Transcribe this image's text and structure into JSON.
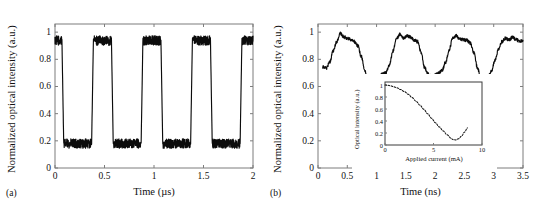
{
  "figure": {
    "panel_a_tag": "(a)",
    "panel_b_tag": "(b)"
  },
  "chart_data": [
    {
      "id": "panel_a",
      "type": "line",
      "title": "",
      "xlabel": "Time (µs)",
      "ylabel": "Normalized optical intensity (a.u.)",
      "xlim": [
        0,
        2
      ],
      "ylim": [
        0,
        1.06
      ],
      "xticks": [
        0,
        0.5,
        1,
        1.5,
        2
      ],
      "xticklabels": [
        "0",
        "0.5",
        "1",
        "1.5",
        "2"
      ],
      "yticks": [
        0,
        0.2,
        0.4,
        0.6,
        0.8,
        1
      ],
      "yticklabels": [
        "0",
        "0.2",
        "0.4",
        "0.6",
        "0.8",
        "1"
      ],
      "grid": false,
      "legend": null,
      "description": "Noisy square-wave modulated optical intensity, period 0.5 microseconds, high level about 0.95, low level about 0.18",
      "waveform": {
        "kind": "square",
        "period_us": 0.5,
        "high_level": 0.95,
        "low_level": 0.18,
        "duty_high": 0.4,
        "phase_offset_us": 0.07,
        "noise_amplitude": 0.035,
        "edge_time_us": 0.018
      },
      "series": [
        {
          "name": "optical intensity",
          "x": [
            0,
            0.07,
            0.09,
            0.34,
            0.37,
            0.56,
            0.58,
            0.84,
            0.87,
            1.06,
            1.08,
            1.34,
            1.37,
            1.56,
            1.58,
            1.84,
            1.87,
            2.0
          ],
          "values": [
            0.95,
            0.93,
            0.18,
            0.17,
            0.96,
            0.94,
            0.18,
            0.17,
            0.97,
            0.94,
            0.18,
            0.18,
            0.95,
            0.94,
            0.19,
            0.18,
            0.97,
            0.93
          ]
        }
      ]
    },
    {
      "id": "panel_b",
      "type": "line",
      "title": "",
      "xlabel": "Time (ns)",
      "ylabel": "Normalized optical intensity (a.u.)",
      "xlim": [
        0,
        3.5
      ],
      "ylim": [
        0,
        1.06
      ],
      "xticks": [
        0,
        0.5,
        1,
        1.5,
        2,
        2.5,
        3,
        3.5
      ],
      "xticklabels": [
        "0",
        "0.5",
        "1",
        "1.5",
        "2",
        "2.5",
        "3",
        "3.5"
      ],
      "yticks": [
        0,
        0.2,
        0.4,
        0.6,
        0.8,
        1
      ],
      "yticklabels": [
        "0",
        "0.2",
        "0.4",
        "0.6",
        "0.8",
        "1"
      ],
      "grid": false,
      "legend": null,
      "description": "Noisy quasi-sinusoidal optical intensity oscillation with period about 0.95 ns, peaks near 1.0 and troughs near 0.62",
      "series": [
        {
          "name": "optical intensity",
          "x": [
            0.08,
            0.14,
            0.2,
            0.26,
            0.32,
            0.38,
            0.44,
            0.5,
            0.56,
            0.62,
            0.68,
            0.74,
            0.8,
            0.86,
            0.92,
            0.98,
            1.04,
            1.1,
            1.16,
            1.22,
            1.28,
            1.34,
            1.4,
            1.46,
            1.52,
            1.58,
            1.64,
            1.7,
            1.76,
            1.82,
            1.88,
            1.94,
            2.0,
            2.06,
            2.12,
            2.18,
            2.24,
            2.3,
            2.36,
            2.42,
            2.48,
            2.54,
            2.6,
            2.66,
            2.72,
            2.78,
            2.84,
            2.9,
            2.96,
            3.02,
            3.08,
            3.14,
            3.2,
            3.26,
            3.32,
            3.38,
            3.44,
            3.5
          ],
          "values": [
            0.745,
            0.735,
            0.78,
            0.86,
            0.93,
            0.99,
            0.965,
            0.955,
            0.945,
            0.93,
            0.9,
            0.82,
            0.72,
            0.63,
            0.605,
            0.64,
            0.675,
            0.69,
            0.7,
            0.76,
            0.86,
            0.95,
            0.985,
            0.955,
            0.97,
            0.965,
            0.94,
            0.93,
            0.85,
            0.74,
            0.69,
            0.675,
            0.685,
            0.7,
            0.72,
            0.78,
            0.87,
            0.955,
            0.975,
            0.95,
            0.945,
            0.94,
            0.92,
            0.85,
            0.74,
            0.665,
            0.65,
            0.665,
            0.71,
            0.79,
            0.87,
            0.93,
            0.955,
            0.945,
            0.96,
            0.945,
            0.935,
            0.94
          ]
        }
      ],
      "inset": {
        "id": "panel_b_inset",
        "type": "line",
        "xlabel": "Applied current (mA)",
        "ylabel": "Optical intensity (a.u.)",
        "xlim": [
          0,
          10
        ],
        "ylim": [
          0,
          1.05
        ],
        "xticks": [
          0,
          5,
          10
        ],
        "xticklabels": [
          "0",
          "5",
          "10"
        ],
        "yticks": [
          0,
          0.2,
          0.4,
          0.6,
          0.8,
          1
        ],
        "yticklabels": [
          "0",
          "0.2",
          "0.4",
          "0.6",
          "0.8",
          "1"
        ],
        "grid": false,
        "linestyle": "dotted",
        "description": "Interferometer transfer function: optical intensity falls from 1 at 0 mA to a minimum near 0.08 at about 7 mA then rises to about 0.28 at 8.5 mA",
        "series": [
          {
            "name": "optical intensity vs applied current",
            "x": [
              0,
              0.3,
              0.6,
              0.9,
              1.2,
              1.6,
              2.0,
              2.4,
              2.8,
              3.2,
              3.6,
              4.0,
              4.4,
              4.8,
              5.2,
              5.6,
              6.0,
              6.4,
              6.8,
              7.0,
              7.3,
              7.6,
              7.9,
              8.2,
              8.5
            ],
            "values": [
              1.0,
              0.995,
              0.985,
              0.97,
              0.955,
              0.925,
              0.89,
              0.845,
              0.79,
              0.73,
              0.665,
              0.595,
              0.52,
              0.445,
              0.37,
              0.3,
              0.235,
              0.17,
              0.115,
              0.09,
              0.085,
              0.105,
              0.15,
              0.215,
              0.285
            ]
          }
        ]
      }
    }
  ]
}
